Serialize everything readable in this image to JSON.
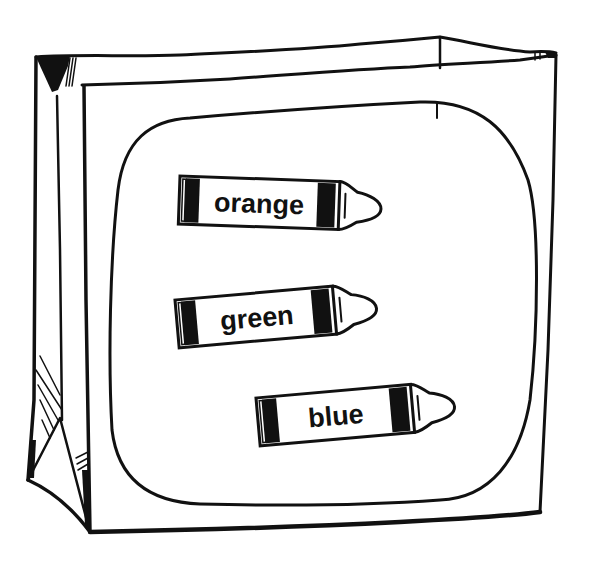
{
  "illustration": {
    "subject": "paper bag with crayon labels",
    "colors": {
      "ink": "#111111",
      "paper": "#ffffff"
    },
    "crayons": [
      {
        "label": "orange",
        "x": 180,
        "y": 176,
        "angle": 2
      },
      {
        "label": "green",
        "x": 173,
        "y": 282,
        "angle": -5
      },
      {
        "label": "blue",
        "x": 256,
        "y": 378,
        "angle": -5
      }
    ]
  }
}
